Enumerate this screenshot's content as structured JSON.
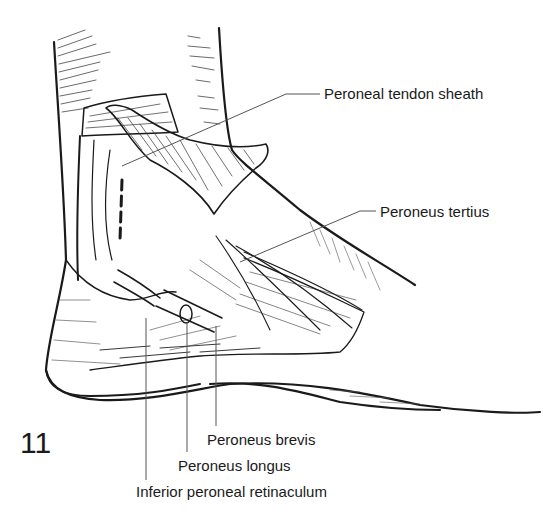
{
  "figure": {
    "number": "11",
    "labels": [
      {
        "id": "peroneal-tendon-sheath",
        "text": "Peroneal tendon sheath",
        "x": 324,
        "y": 87
      },
      {
        "id": "peroneus-tertius",
        "text": "Peroneus tertius",
        "x": 380,
        "y": 205
      },
      {
        "id": "peroneus-brevis",
        "text": "Peroneus brevis",
        "x": 207,
        "y": 433
      },
      {
        "id": "peroneus-longus",
        "text": "Peroneus longus",
        "x": 178,
        "y": 459
      },
      {
        "id": "inferior-peroneal-retinaculum",
        "text": "Inferior peroneal retinaculum",
        "x": 136,
        "y": 485
      }
    ]
  },
  "colors": {
    "ink": "#1a1a1a",
    "leader": "#555555",
    "background": "#ffffff"
  }
}
